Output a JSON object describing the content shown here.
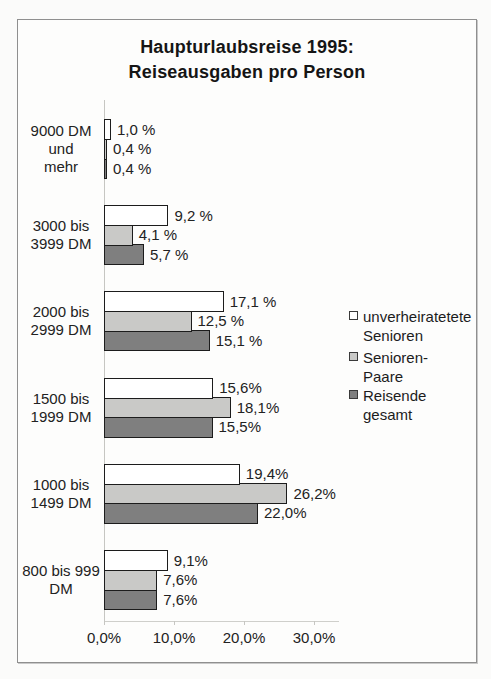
{
  "title": {
    "line1": "Haupturlaubsreise 1995:",
    "line2": "Reiseausgaben pro Person"
  },
  "chart_data": {
    "type": "bar",
    "orientation": "horizontal",
    "title": "Haupturlaubsreise 1995: Reiseausgaben pro Person",
    "categories": [
      "9000 DM und mehr",
      "3000 bis 3999 DM",
      "2000 bis 2999 DM",
      "1500 bis 1999 DM",
      "1000 bis 1499 DM",
      "800 bis 999 DM"
    ],
    "category_label_lines": [
      [
        "9000 DM und",
        "mehr"
      ],
      [
        "3000 bis",
        "3999 DM"
      ],
      [
        "2000 bis",
        "2999 DM"
      ],
      [
        "1500 bis",
        "1999 DM"
      ],
      [
        "1000 bis",
        "1499 DM"
      ],
      [
        "800 bis 999",
        "DM"
      ]
    ],
    "series": [
      {
        "name": "unverheiratetete Senioren",
        "color": "#ffffff",
        "values": [
          1.0,
          9.2,
          17.1,
          15.6,
          19.4,
          9.1
        ],
        "value_labels": [
          "1,0 %",
          "9,2 %",
          "17,1 %",
          "15,6%",
          "19,4%",
          "9,1%"
        ]
      },
      {
        "name": "Senioren-Paare",
        "color": "#c9c9c7",
        "values": [
          0.4,
          4.1,
          12.5,
          18.1,
          26.2,
          7.6
        ],
        "value_labels": [
          "0,4 %",
          "4,1 %",
          "12,5 %",
          "18,1%",
          "26,2%",
          "7,6%"
        ]
      },
      {
        "name": "Reisende gesamt",
        "color": "#7f7f7f",
        "values": [
          0.4,
          5.7,
          15.1,
          15.5,
          22.0,
          7.6
        ],
        "value_labels": [
          "0,4 %",
          "5,7 %",
          "15,1 %",
          "15,5%",
          "22,0%",
          "7,6%"
        ]
      }
    ],
    "x_ticks": [
      "0,0%",
      "10,0%",
      "20,0%",
      "30,0%"
    ],
    "x_tick_values": [
      0,
      10,
      20,
      30
    ],
    "xlim": [
      0,
      33.5
    ],
    "xlabel": "",
    "ylabel": "",
    "grid": false,
    "legend_position": "right",
    "bar_border_color": "#1c1c1c"
  }
}
